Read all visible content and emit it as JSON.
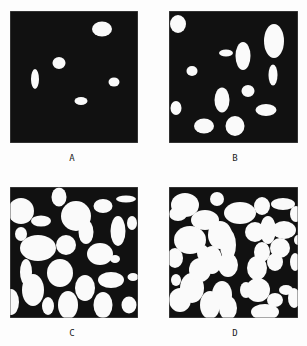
{
  "figure": {
    "background": "#fdfdfd",
    "panel_fill": "#111111",
    "panel_stroke": "#555555",
    "particle_fill": "#fafafa"
  },
  "panels": [
    {
      "id": "A",
      "label": "A",
      "x": 10,
      "y": 11,
      "w": 128,
      "h": 132,
      "label_x": 72,
      "label_y": 153,
      "ellipses": [
        [
          102,
          29,
          10,
          7.5
        ],
        [
          59,
          63,
          6.5,
          6
        ],
        [
          35,
          79,
          4,
          10
        ],
        [
          114,
          82,
          5.5,
          4.5
        ],
        [
          81,
          101,
          6.5,
          4
        ]
      ]
    },
    {
      "id": "B",
      "label": "B",
      "x": 169,
      "y": 11,
      "w": 129,
      "h": 132,
      "label_x": 235,
      "label_y": 153,
      "ellipses": [
        [
          178,
          24,
          8,
          9
        ],
        [
          274,
          41,
          10,
          17
        ],
        [
          226,
          53,
          7,
          3.5
        ],
        [
          243,
          56,
          7.5,
          14
        ],
        [
          192,
          71,
          5.5,
          5
        ],
        [
          273,
          75,
          4.5,
          10.5
        ],
        [
          248,
          91,
          6.5,
          6
        ],
        [
          222,
          100,
          7.5,
          12.5
        ],
        [
          176,
          108,
          5.5,
          7
        ],
        [
          266,
          110,
          10.5,
          6
        ],
        [
          204,
          126,
          10,
          7.5
        ],
        [
          235,
          126,
          9.5,
          10
        ]
      ]
    },
    {
      "id": "C",
      "label": "C",
      "x": 10,
      "y": 187,
      "w": 128,
      "h": 131,
      "label_x": 72,
      "label_y": 328,
      "ellipses": [
        [
          21,
          211,
          13,
          13
        ],
        [
          59,
          197,
          7.5,
          9.5
        ],
        [
          41,
          221,
          10,
          5.5
        ],
        [
          76,
          216,
          15,
          15
        ],
        [
          86,
          232,
          7.5,
          12
        ],
        [
          103,
          206,
          9.5,
          7
        ],
        [
          126,
          199,
          10,
          3.5
        ],
        [
          118,
          231,
          7.5,
          15
        ],
        [
          132,
          223,
          5,
          7
        ],
        [
          21,
          234,
          6,
          7
        ],
        [
          38,
          248,
          18,
          13
        ],
        [
          66,
          245,
          10,
          10
        ],
        [
          86,
          238,
          6,
          5
        ],
        [
          100,
          254,
          13,
          11
        ],
        [
          115,
          259,
          5,
          4
        ],
        [
          26,
          272,
          6,
          13
        ],
        [
          60,
          273,
          13,
          14
        ],
        [
          111,
          280,
          13,
          8
        ],
        [
          133,
          277,
          5.5,
          4
        ],
        [
          85,
          288,
          10,
          13
        ],
        [
          33,
          290,
          11,
          16
        ],
        [
          11,
          302,
          8,
          13
        ],
        [
          48,
          306,
          6,
          9
        ],
        [
          68,
          305,
          10,
          14
        ],
        [
          103,
          305,
          9.5,
          13
        ],
        [
          129,
          305,
          7.5,
          8.5
        ]
      ]
    },
    {
      "id": "D",
      "label": "D",
      "x": 169,
      "y": 187,
      "w": 129,
      "h": 131,
      "label_x": 235,
      "label_y": 328,
      "ellipses": [
        [
          185,
          205,
          14,
          12
        ],
        [
          217,
          199,
          7,
          7
        ],
        [
          205,
          220,
          14,
          10
        ],
        [
          240,
          213,
          16,
          11
        ],
        [
          262,
          206,
          8,
          9
        ],
        [
          283,
          204,
          12,
          6
        ],
        [
          296,
          214,
          6,
          8
        ],
        [
          178,
          214,
          9,
          7
        ],
        [
          190,
          240,
          16,
          14
        ],
        [
          175,
          258,
          8,
          10
        ],
        [
          220,
          235,
          12,
          14
        ],
        [
          212,
          260,
          10,
          14
        ],
        [
          228,
          245,
          8,
          16
        ],
        [
          255,
          232,
          10,
          10
        ],
        [
          268,
          230,
          8,
          14
        ],
        [
          284,
          230,
          12,
          9
        ],
        [
          280,
          248,
          10,
          10
        ],
        [
          262,
          252,
          8,
          10
        ],
        [
          295,
          262,
          5,
          9
        ],
        [
          257,
          268,
          10,
          12
        ],
        [
          275,
          262,
          8,
          9
        ],
        [
          294,
          298,
          6,
          10
        ],
        [
          192,
          288,
          12,
          15
        ],
        [
          200,
          270,
          11,
          12
        ],
        [
          222,
          295,
          10,
          14
        ],
        [
          180,
          300,
          11,
          12
        ],
        [
          210,
          305,
          10,
          14
        ],
        [
          228,
          265,
          10,
          12
        ],
        [
          258,
          290,
          12,
          12
        ],
        [
          275,
          300,
          8,
          7
        ],
        [
          286,
          290,
          7,
          5
        ],
        [
          246,
          290,
          6,
          8
        ],
        [
          228,
          308,
          9,
          12
        ],
        [
          265,
          312,
          14,
          8
        ],
        [
          176,
          280,
          5,
          6
        ],
        [
          203,
          253,
          6,
          8
        ],
        [
          298,
          240,
          4,
          5
        ]
      ]
    }
  ]
}
